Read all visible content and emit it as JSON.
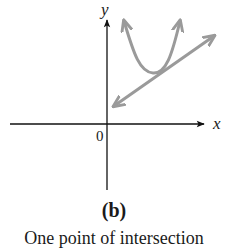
{
  "figure": {
    "axis_labels": {
      "x": "x",
      "y": "y",
      "origin": "0"
    },
    "caption_label": "(b)",
    "caption_text": "One point of intersection",
    "colors": {
      "axes": "#111111",
      "curves": "#9a9a9a",
      "text": "#1a1a1a"
    },
    "curves": [
      {
        "name": "parabola",
        "description": "upward-opening parabola with arrows at both ends"
      },
      {
        "name": "line",
        "description": "straight line with arrows at both ends, tangent to parabola"
      }
    ]
  }
}
